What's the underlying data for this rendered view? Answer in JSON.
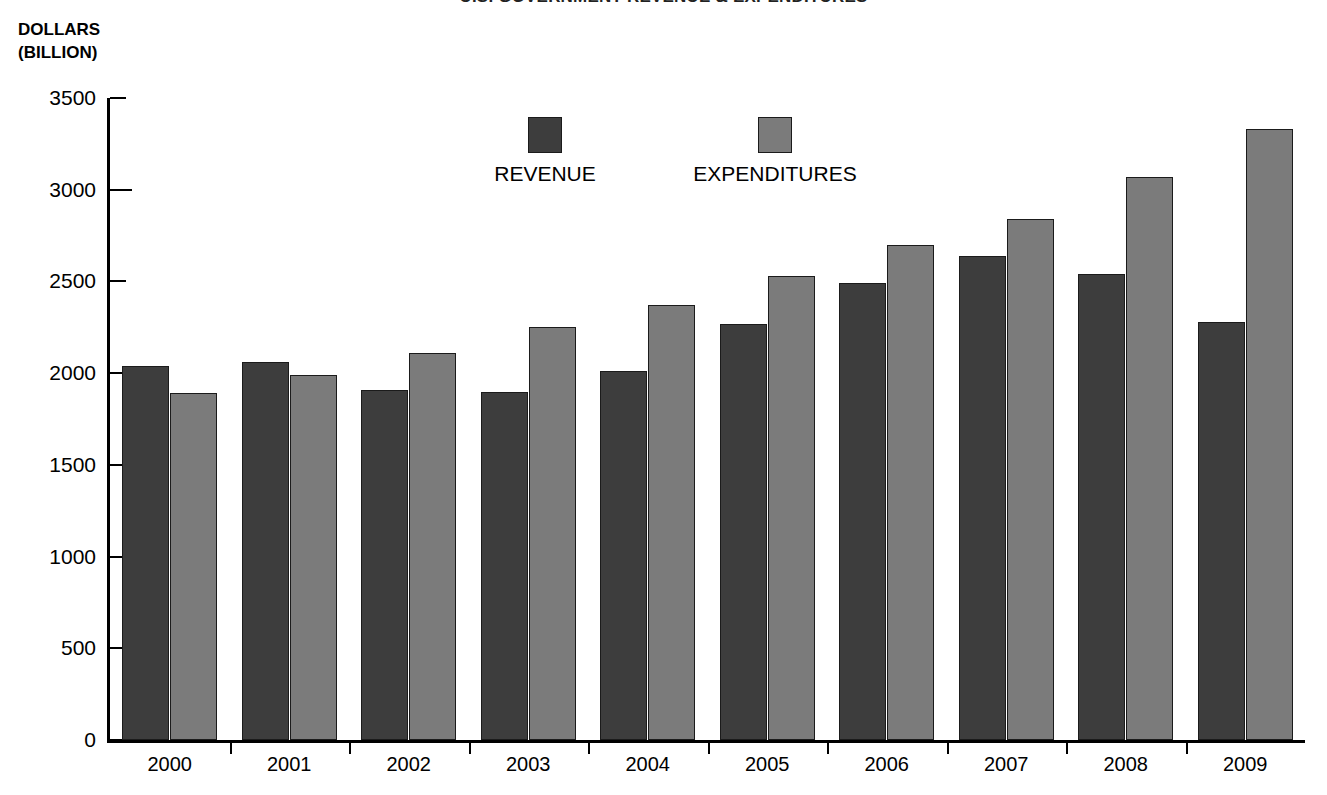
{
  "chart_data": {
    "type": "bar",
    "title": "U.S. GOVERNMENT REVENUE & EXPENDITURES",
    "xlabel": "",
    "ylabel": "DOLLARS (BILLION)",
    "ylabel_lines": [
      "DOLLARS",
      "(BILLION)"
    ],
    "categories": [
      "2000",
      "2001",
      "2002",
      "2003",
      "2004",
      "2005",
      "2006",
      "2007",
      "2008",
      "2009"
    ],
    "series": [
      {
        "name": "REVENUE",
        "color": "#3d3d3d",
        "values": [
          2040,
          2060,
          1910,
          1900,
          2010,
          2270,
          2490,
          2640,
          2540,
          2280
        ]
      },
      {
        "name": "EXPENDITURES",
        "color": "#7b7b7b",
        "values": [
          1890,
          1990,
          2110,
          2250,
          2370,
          2530,
          2700,
          2840,
          3070,
          3330
        ]
      }
    ],
    "ylim": [
      0,
      3500
    ],
    "ytick_labels": [
      "0",
      "500",
      "1000",
      "1500",
      "2000",
      "2500",
      "3000",
      "3500"
    ],
    "yticks": [
      0,
      500,
      1000,
      1500,
      2000,
      2500,
      3000,
      3500
    ],
    "grid": false,
    "legend_position": "top-center"
  }
}
